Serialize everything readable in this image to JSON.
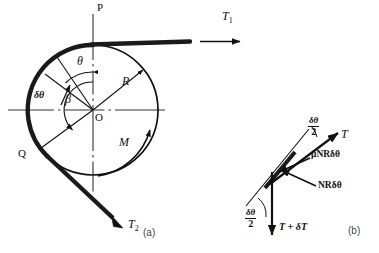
{
  "figure": {
    "panels": [
      {
        "id": "a",
        "caption": "(a)",
        "caption_x": 143,
        "caption_y": 227
      },
      {
        "id": "b",
        "caption": "(b)",
        "caption_x": 348,
        "caption_y": 225
      }
    ],
    "colors": {
      "ink": "#111111",
      "band": "#1a1a1a",
      "thin": "#333333",
      "background": "#ffffff"
    }
  },
  "panel_a": {
    "name": "drum-and-band-diagram",
    "center_label": "O",
    "vertical_axis_label": "P",
    "radius_label": "R",
    "angle_theta_label": "θ",
    "angle_delta_theta_label": "δθ",
    "angle_beta_label": "β",
    "moment_label": "M",
    "point_q_label": "Q",
    "tension_1": "T",
    "tension_1_sub": "1",
    "tension_2": "T",
    "tension_2_sub": "2",
    "geometry": {
      "center_x": 93,
      "center_y": 110,
      "radius": 65,
      "drum_line_width": 1.6,
      "band_line_width": 4.2
    }
  },
  "panel_b": {
    "name": "band-element-free-body",
    "tension_label": "T",
    "tension_plus_label": "T + δT",
    "friction_label": "μNRδθ",
    "normal_label": "NRδθ",
    "half_angle_top_num": "δθ",
    "half_angle_top_den": "2",
    "half_angle_bottom_num": "δθ",
    "half_angle_bottom_den": "2"
  }
}
